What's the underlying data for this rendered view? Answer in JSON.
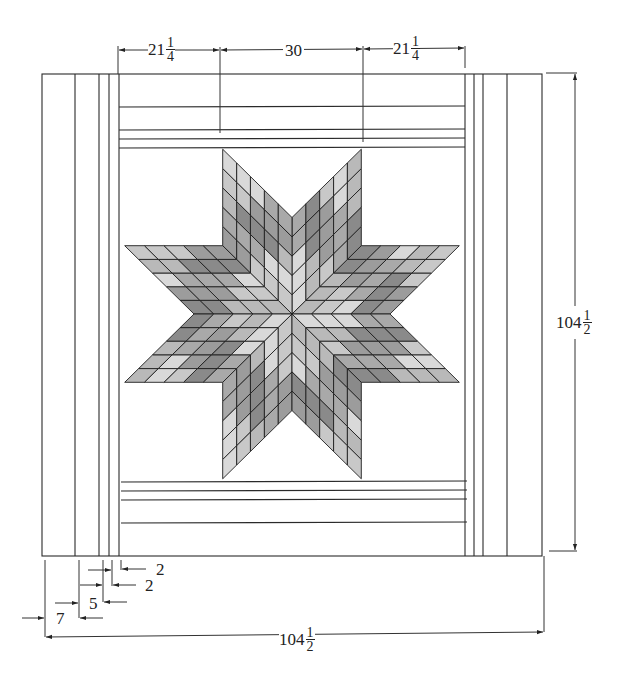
{
  "diagram": {
    "type": "quilt-plan",
    "star": {
      "points": 8,
      "diamonds_per_side": 5,
      "center": [
        292,
        314
      ],
      "shades": [
        "#b9b9b9",
        "#9c9c9c",
        "#d9d9d9",
        "#8a8a8a",
        "#c8c8c8",
        "#a9a9a9"
      ]
    },
    "dimensions": {
      "top": [
        {
          "whole": "21",
          "num": "1",
          "den": "4"
        },
        {
          "whole": "30",
          "num": "",
          "den": ""
        },
        {
          "whole": "21",
          "num": "1",
          "den": "4"
        }
      ],
      "right": {
        "whole": "104",
        "num": "1",
        "den": "2"
      },
      "bottom": {
        "whole": "104",
        "num": "1",
        "den": "2"
      },
      "border_widths": [
        {
          "label": "2"
        },
        {
          "label": "2"
        },
        {
          "label": "5"
        },
        {
          "label": "7"
        }
      ]
    }
  }
}
